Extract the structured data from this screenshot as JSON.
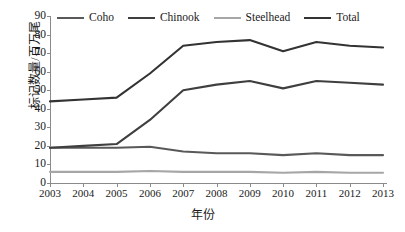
{
  "chart_data": {
    "type": "line",
    "title": "",
    "xlabel": "年份",
    "ylabel": "标记数量/百万尾",
    "categories": [
      "2003",
      "2004",
      "2005",
      "2006",
      "2007",
      "2008",
      "2009",
      "2010",
      "2011",
      "2012",
      "2013"
    ],
    "xlim": [
      2003,
      2013
    ],
    "ylim": [
      0,
      90
    ],
    "yticks": [
      0,
      10,
      20,
      30,
      40,
      50,
      60,
      70,
      80,
      90
    ],
    "grid": false,
    "legend_position": "top",
    "series": [
      {
        "name": "Coho",
        "color": "#595959",
        "values": [
          19,
          19,
          19,
          19.5,
          17,
          16,
          16,
          15,
          16,
          15,
          15
        ]
      },
      {
        "name": "Chinook",
        "color": "#3f3f3f",
        "values": [
          19,
          20,
          21,
          34,
          50,
          53,
          55,
          51,
          55,
          54,
          53
        ]
      },
      {
        "name": "Steelhead",
        "color": "#a6a6a6",
        "values": [
          6,
          6,
          6,
          6.5,
          6,
          6,
          6,
          5.5,
          6,
          5.5,
          5.5
        ]
      },
      {
        "name": "Total",
        "color": "#333333",
        "values": [
          44,
          45,
          46,
          59,
          74,
          76,
          77,
          71,
          76,
          74,
          73
        ]
      }
    ]
  },
  "axis": {
    "y_labels": [
      "90",
      "80",
      "70",
      "60",
      "50",
      "40",
      "30",
      "20",
      "10",
      "0"
    ],
    "x_labels": [
      "2003",
      "2004",
      "2005",
      "2006",
      "2007",
      "2008",
      "2009",
      "2010",
      "2011",
      "2012",
      "2013"
    ],
    "y_title": "标记数量/百万尾",
    "x_title": "年份"
  },
  "legend": {
    "items": [
      {
        "label": "Coho",
        "color": "#595959"
      },
      {
        "label": "Chinook",
        "color": "#3f3f3f"
      },
      {
        "label": "Steelhead",
        "color": "#a6a6a6"
      },
      {
        "label": "Total",
        "color": "#333333"
      }
    ]
  },
  "colors": {
    "axis": "#8a8a8a",
    "text": "#1a1a1a",
    "background": "#ffffff"
  }
}
